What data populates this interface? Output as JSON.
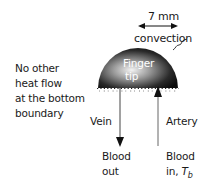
{
  "diagram": {
    "dimension_label": "7 mm",
    "convection_label": "convection",
    "finger_label": [
      "Finger",
      "tip"
    ],
    "boundary_note": [
      "No other",
      "heat flow",
      "at the bottom",
      "boundary"
    ],
    "vein_label": "Vein",
    "artery_label": "Artery",
    "blood_out_label": [
      "Blood",
      "out"
    ],
    "blood_in_label": [
      "Blood",
      "in, "
    ],
    "blood_in_symbol": "T",
    "blood_in_subscript": "b",
    "colors": {
      "hemisphere_dark": "#111111",
      "hemisphere_light": "#f2f2f2",
      "text": "#1a1a1a",
      "finger_text": "#ffffff"
    }
  }
}
